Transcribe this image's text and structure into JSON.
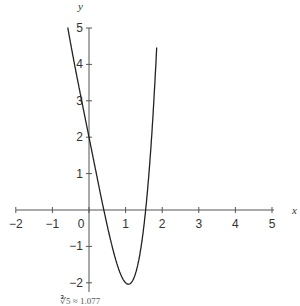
{
  "chart_data": {
    "type": "line",
    "title": "",
    "function": "f(x) = x^4 - 5x + 2",
    "xlabel": "x",
    "ylabel": "y",
    "xlim": [
      -2,
      5
    ],
    "ylim": [
      -2,
      5
    ],
    "x_ticks": [
      "-2",
      "-1",
      "0",
      "1",
      "2",
      "3",
      "4",
      "5"
    ],
    "y_ticks": [
      "-2",
      "-1",
      "1",
      "2",
      "3",
      "4",
      "5"
    ],
    "grid": false,
    "series": [
      {
        "name": "f(x)",
        "x": [
          -0.58,
          -0.4,
          -0.2,
          0,
          0.2,
          0.4,
          0.6,
          0.8,
          1.0,
          1.077,
          1.2,
          1.4,
          1.6,
          1.8,
          1.85
        ],
        "values": [
          5.01,
          4.03,
          3.0,
          2.0,
          1.0,
          0.03,
          -0.87,
          -1.59,
          -2.0,
          -2.04,
          -1.93,
          -1.16,
          0.55,
          3.5,
          4.46
        ]
      }
    ],
    "annotations": [
      "minimum at x = ∛(5/4) ≈ 1.077"
    ],
    "caption_partial": "∛5 ≈ 1.077"
  }
}
